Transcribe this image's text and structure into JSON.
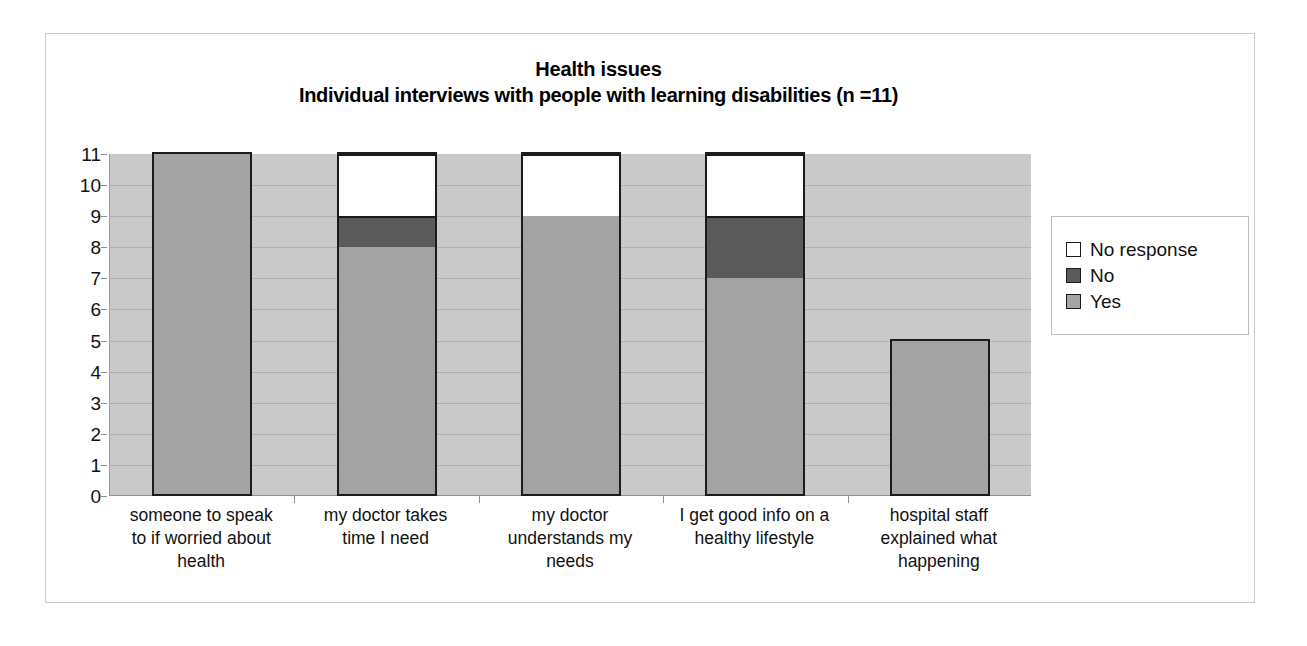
{
  "chart_data": {
    "type": "bar",
    "subtype": "stacked-vertical",
    "title": "Health issues",
    "subtitle": "Individual interviews with people with learning disabilities (n =11)",
    "xlabel": "",
    "ylabel": "",
    "ylim": [
      0,
      11
    ],
    "yticks": [
      0,
      1,
      2,
      3,
      4,
      5,
      6,
      7,
      8,
      9,
      10,
      11
    ],
    "grid": true,
    "legend_position": "right",
    "categories": [
      "someone to speak to if worried about health",
      "my doctor takes time I need",
      "my doctor understands my needs",
      "I get good info on a healthy lifestyle",
      "hospital staff explained what happening"
    ],
    "category_lines": [
      [
        "someone to speak",
        "to if worried about",
        "health"
      ],
      [
        "my doctor takes",
        "time I need"
      ],
      [
        "my doctor",
        "understands my",
        "needs"
      ],
      [
        "I get good info on a",
        "healthy lifestyle"
      ],
      [
        "hospital staff",
        "explained what",
        "happening"
      ]
    ],
    "series": [
      {
        "name": "Yes",
        "color": "#a3a3a3",
        "values": [
          11,
          8,
          9,
          7,
          5
        ]
      },
      {
        "name": "No",
        "color": "#5a5a5a",
        "values": [
          0,
          1,
          0,
          2,
          0
        ]
      },
      {
        "name": "No response",
        "color": "#ffffff",
        "values": [
          0,
          2,
          2,
          2,
          0
        ]
      }
    ],
    "stack_order_bottom_to_top": [
      "Yes",
      "No",
      "No response"
    ],
    "legend_entries": [
      {
        "label": "No response",
        "color": "#ffffff"
      },
      {
        "label": "No",
        "color": "#5a5a5a"
      },
      {
        "label": "Yes",
        "color": "#a3a3a3"
      }
    ],
    "plot_background": "#c9c9c9",
    "bar_border": "#1b1b1b"
  }
}
